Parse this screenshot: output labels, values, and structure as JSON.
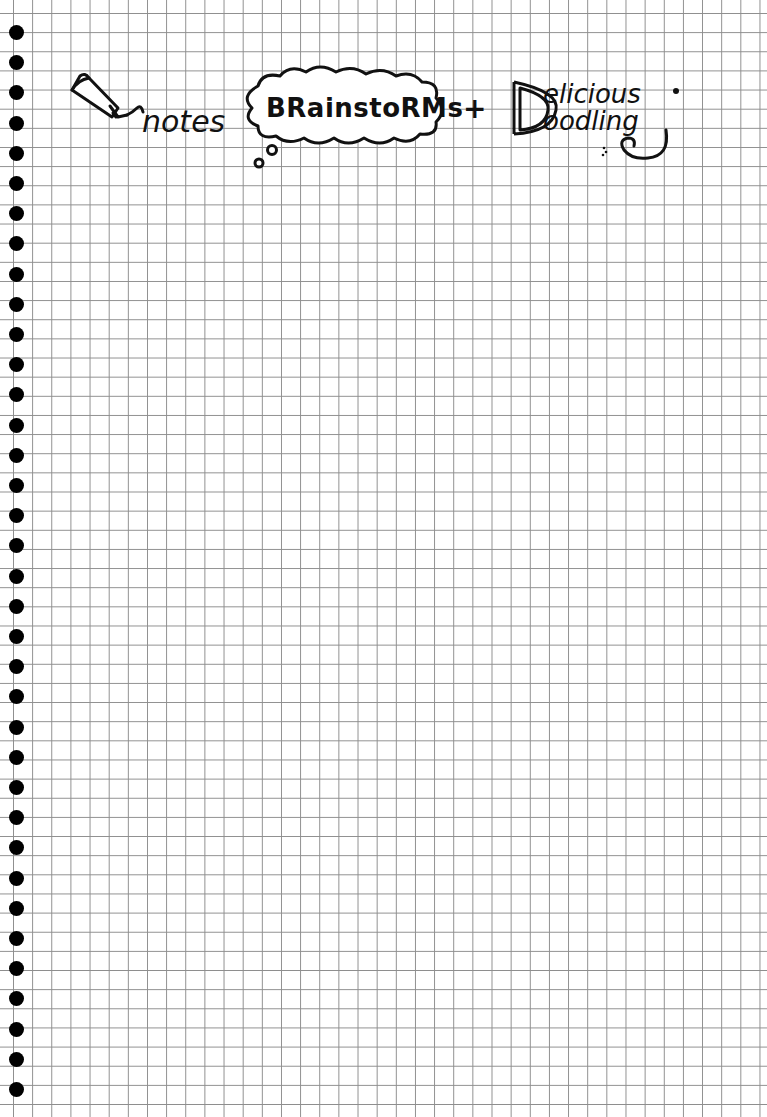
{
  "page": {
    "type": "graph-paper-notebook-page",
    "background_color": "#ffffff",
    "grid_color": "#7a7a7a",
    "ink_color": "#111111",
    "binding_holes_count": 36
  },
  "header": {
    "word_1": "notes",
    "word_2": "BRainstoRMs",
    "connector": "+",
    "word_3_line_1": "elicious",
    "word_3_line_2": "oodling",
    "word_3_initial": "D",
    "full_title": "notes BRainstoRMs + Delicious Doodling"
  },
  "icons": {
    "pencil": "pencil-icon",
    "thought_bubble": "thought-bubble-icon",
    "swirl": "swirl-flourish-icon"
  }
}
